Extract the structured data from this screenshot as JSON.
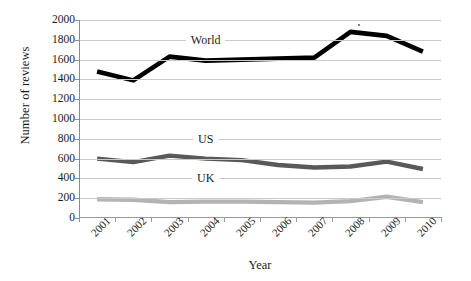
{
  "chart_data": {
    "type": "line",
    "title": "",
    "xlabel": "Year",
    "ylabel": "Number of reviews",
    "categories": [
      "2001",
      "2002",
      "2003",
      "2004",
      "2005",
      "2006",
      "2007",
      "2008",
      "2009",
      "2010"
    ],
    "ylim": [
      0,
      2000
    ],
    "y_ticks": [
      0,
      200,
      400,
      600,
      800,
      1000,
      1200,
      1400,
      1600,
      1800,
      2000
    ],
    "y_tick_labels": [
      "0",
      "200",
      "400",
      "600",
      "800",
      "1000",
      "1200",
      "1400",
      "1600",
      "1800",
      "2000"
    ],
    "grid": true,
    "legend_position": "inline-annotations",
    "series": [
      {
        "name": "World",
        "color": "#000000",
        "values": [
          1480,
          1390,
          1630,
          1590,
          1600,
          1610,
          1620,
          1880,
          1840,
          1680
        ]
      },
      {
        "name": "US",
        "color": "#595959",
        "values": [
          600,
          565,
          630,
          600,
          585,
          535,
          510,
          520,
          570,
          495
        ]
      },
      {
        "name": "UK",
        "color": "#b3b3b3",
        "values": [
          190,
          185,
          160,
          165,
          165,
          160,
          155,
          170,
          215,
          160
        ]
      }
    ],
    "annotations": [
      {
        "text": "World",
        "x_category": "2004",
        "y_value": 1800
      },
      {
        "text": "US",
        "x_category": "2004",
        "y_value": 800
      },
      {
        "text": "UK",
        "x_category": "2004",
        "y_value": 400
      }
    ]
  }
}
